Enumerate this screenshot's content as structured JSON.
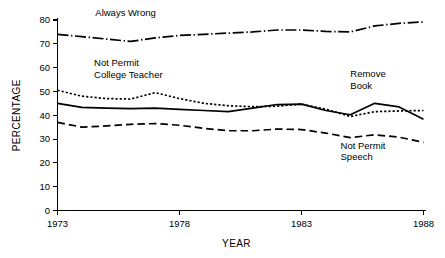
{
  "chart_data": {
    "type": "line",
    "title": "",
    "xlabel": "YEAR",
    "ylabel": "PERCENTAGE",
    "xlim": [
      1973,
      1988
    ],
    "ylim": [
      0,
      80
    ],
    "grid": false,
    "legend_position": "inline-annotations",
    "x": [
      1973,
      1974,
      1975,
      1976,
      1977,
      1978,
      1979,
      1980,
      1981,
      1982,
      1983,
      1984,
      1985,
      1986,
      1987,
      1988
    ],
    "y_ticks": [
      0,
      10,
      20,
      30,
      40,
      50,
      60,
      70,
      80
    ],
    "y_tick_labels": [
      "0",
      "10",
      "20",
      "30",
      "40",
      "50",
      "60",
      "70",
      "80"
    ],
    "x_ticks": [
      1973,
      1978,
      1983,
      1988
    ],
    "x_tick_labels": [
      "1973",
      "1978",
      "1983",
      "1988"
    ],
    "series": [
      {
        "name": "Always Wrong",
        "style": "dashdot",
        "label_text_lines": [
          "Always Wrong"
        ],
        "values": [
          74.0,
          73.0,
          72.0,
          71.0,
          72.5,
          73.5,
          74.0,
          74.5,
          75.0,
          75.8,
          75.8,
          75.2,
          75.0,
          77.5,
          78.6,
          79.2
        ]
      },
      {
        "name": "Not Permit College Teacher",
        "style": "dotted",
        "label_text_lines": [
          "Not Permit",
          "College Teacher"
        ],
        "values": [
          50.5,
          48.0,
          47.0,
          46.8,
          49.5,
          47.0,
          45.0,
          44.0,
          43.6,
          43.8,
          44.7,
          42.5,
          39.5,
          41.5,
          41.8,
          42.0
        ]
      },
      {
        "name": "Remove Book",
        "style": "solid",
        "label_text_lines": [
          "Remove",
          "Book"
        ],
        "values": [
          45.0,
          43.3,
          43.0,
          42.8,
          43.0,
          42.5,
          42.0,
          41.5,
          43.0,
          44.5,
          44.7,
          42.0,
          40.2,
          45.0,
          43.5,
          38.3
        ]
      },
      {
        "name": "Not Permit Speech",
        "style": "dashed",
        "label_text_lines": [
          "Not Permit",
          "Speech"
        ],
        "values": [
          37.0,
          35.0,
          35.5,
          36.2,
          36.5,
          35.8,
          34.5,
          33.5,
          33.5,
          34.2,
          34.0,
          32.5,
          30.6,
          31.8,
          30.8,
          28.6
        ]
      }
    ],
    "annotations": [
      {
        "name": "always-wrong",
        "text_lines": [
          "Always Wrong"
        ],
        "x": 1974.55,
        "y": 81.5,
        "anchor": "start"
      },
      {
        "name": "not-permit-college-teacher",
        "text_lines": [
          "Not Permit",
          "College Teacher"
        ],
        "x": 1974.5,
        "y": 60.5,
        "anchor": "start"
      },
      {
        "name": "remove-book",
        "text_lines": [
          "Remove",
          "Book"
        ],
        "x": 1985.0,
        "y": 56.0,
        "anchor": "start"
      },
      {
        "name": "not-permit-speech",
        "text_lines": [
          "Not Permit",
          "Speech"
        ],
        "x": 1984.6,
        "y": 26.0,
        "anchor": "start"
      }
    ]
  }
}
